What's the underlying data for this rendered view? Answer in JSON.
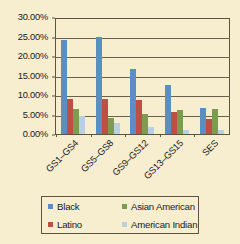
{
  "chart_data": {
    "type": "bar",
    "title": "",
    "subtitle": "",
    "xlabel": "",
    "ylabel": "",
    "categories": [
      "GS1–GS4",
      "GS5–GS8",
      "GS9–GS12",
      "GS13–GS15",
      "SES"
    ],
    "series": [
      {
        "name": "Black",
        "color": "#5b8fc4",
        "values": [
          24.6,
          25.3,
          17.0,
          12.7,
          6.7
        ]
      },
      {
        "name": "Latino",
        "color": "#bf4f45",
        "values": [
          9.2,
          9.2,
          9.0,
          5.7,
          4.0
        ]
      },
      {
        "name": "Asian American",
        "color": "#7e9b4e",
        "values": [
          6.4,
          4.3,
          5.2,
          6.3,
          6.4
        ]
      },
      {
        "name": "American Indian",
        "color": "#b9cfe4",
        "values": [
          4.8,
          3.0,
          1.7,
          1.0,
          1.1
        ]
      }
    ],
    "ylim": [
      0,
      30
    ],
    "ytick_values": [
      0,
      5,
      10,
      15,
      20,
      25,
      30
    ],
    "ytick_labels": [
      "0.00%",
      "5.00%",
      "10.00%",
      "15.00%",
      "20.00%",
      "25.00%",
      "30.00%"
    ],
    "grid": true,
    "legend_position": "bottom",
    "legend_entries": [
      "Black",
      "Asian American",
      "Latino",
      "American Indian"
    ],
    "background_color": "#f7edcf",
    "axis_color": "#5d5341"
  }
}
